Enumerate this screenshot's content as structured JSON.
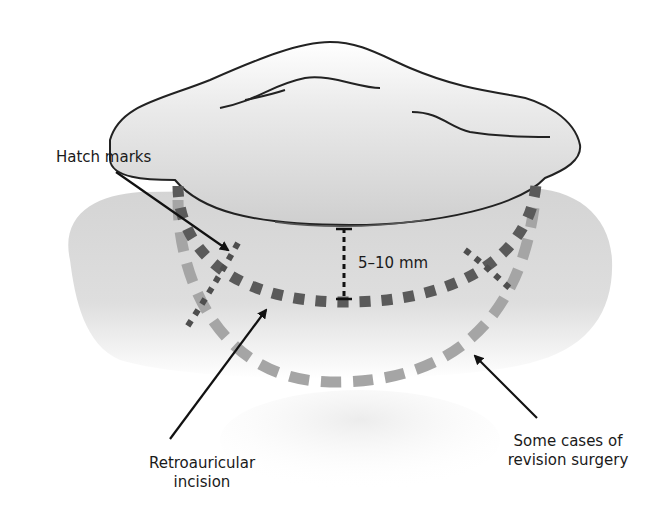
{
  "figure": {
    "labels": {
      "hatch_marks": "Hatch marks",
      "distance": "5–10 mm",
      "retroauricular": "Retroauricular",
      "retroauricular_line2": "incision",
      "revision": "Some cases of",
      "revision_line2": "revision surgery"
    },
    "colors": {
      "ear_fill": "#e3e3e3",
      "ear_outline": "#222222",
      "skin_fill": "#d6d6d6",
      "primary_incision": "#5a5a5a",
      "revision_incision": "#a5a5a5",
      "hatch_mark": "#4e4e4e",
      "arrow": "#111111"
    }
  }
}
